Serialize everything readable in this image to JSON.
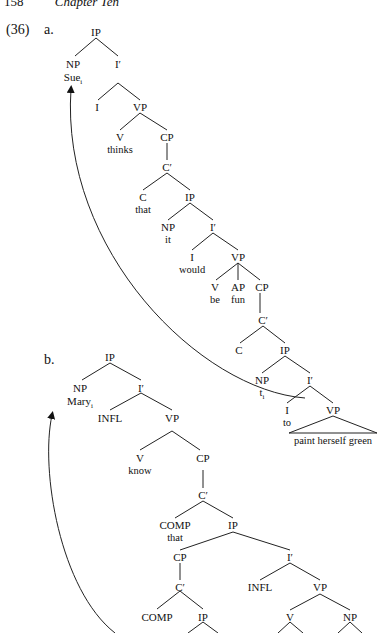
{
  "header": {
    "page_number": "158",
    "chapter": "Chapter Ten"
  },
  "example": {
    "number": "(36)",
    "a_label": "a.",
    "b_label": "b."
  },
  "tree_a": {
    "root": "IP",
    "np_subject": "NP",
    "subject": "Sue",
    "subject_index": "i",
    "ibar1": "I′",
    "i1": "I",
    "vp1": "VP",
    "v1": "V",
    "verb1": "thinks",
    "cp1": "CP",
    "cbar1": "C′",
    "c1": "C",
    "comp1": "that",
    "ip2": "IP",
    "np2": "NP",
    "np2_word": "it",
    "ibar2": "I′",
    "i2": "I",
    "aux2": "would",
    "vp2": "VP",
    "v2": "V",
    "verb2": "be",
    "ap": "AP",
    "adj": "fun",
    "cp2": "CP",
    "cbar2": "C′",
    "c2": "C",
    "ip3": "IP",
    "np3": "NP",
    "trace": "t",
    "trace_index": "i",
    "ibar3": "I′",
    "i3": "I",
    "to": "to",
    "vp3": "VP",
    "vp3_words": "paint herself green"
  },
  "tree_b": {
    "root": "IP",
    "np_subject": "NP",
    "subject": "Mary",
    "subject_index": "i",
    "ibar1": "I′",
    "infl1": "INFL",
    "vp1": "VP",
    "v1": "V",
    "verb1": "know",
    "cp1": "CP",
    "cbar1": "C′",
    "comp1": "COMP",
    "comp1_word": "that",
    "ip2": "IP",
    "cp2": "CP",
    "cbar2": "C′",
    "comp2": "COMP",
    "ip3": "IP",
    "ibar2": "I′",
    "infl2": "INFL",
    "vp2": "VP",
    "v2": "V",
    "np2": "NP"
  }
}
